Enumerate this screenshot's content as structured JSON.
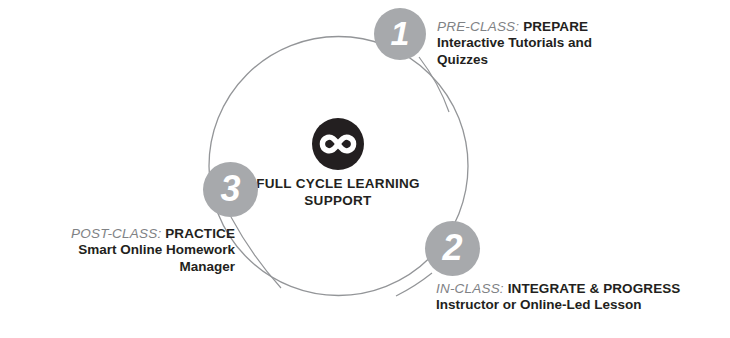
{
  "diagram": {
    "center": {
      "logo_icon": "infinity-icon",
      "title": "FULL CYCLE LEARNING\nSUPPORT",
      "logo_bg_color": "#231f20",
      "logo_fg_color": "#ffffff"
    },
    "ring": {
      "color": "#808285",
      "badge_color": "#a7a9ac",
      "badge_text_color": "#ffffff"
    },
    "steps": [
      {
        "number": "1",
        "kicker": "PRE-CLASS:",
        "headline": "PREPARE",
        "sub": "Interactive Tutorials and\nQuizzes"
      },
      {
        "number": "2",
        "kicker": "IN-CLASS:",
        "headline": "INTEGRATE & PROGRESS",
        "sub": "Instructor or Online-Led Lesson"
      },
      {
        "number": "3",
        "kicker": "POST-CLASS:",
        "headline": "PRACTICE",
        "sub": "Smart Online Homework\nManager"
      }
    ]
  }
}
